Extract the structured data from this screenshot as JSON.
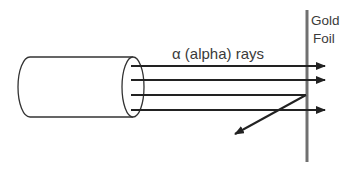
{
  "diagram": {
    "ray_label": "α (alpha) rays",
    "foil_label_line1": "Gold",
    "foil_label_line2": "Foil",
    "colors": {
      "ray": "#222222",
      "foil": "#707070",
      "outline": "#333333",
      "text": "#3a3a3a"
    },
    "components": [
      {
        "name": "alpha-source-cylinder"
      },
      {
        "name": "gold-foil"
      },
      {
        "name": "alpha-ray",
        "behavior": "passes-through",
        "count": 3
      },
      {
        "name": "alpha-ray",
        "behavior": "deflected-back",
        "count": 1
      }
    ]
  }
}
